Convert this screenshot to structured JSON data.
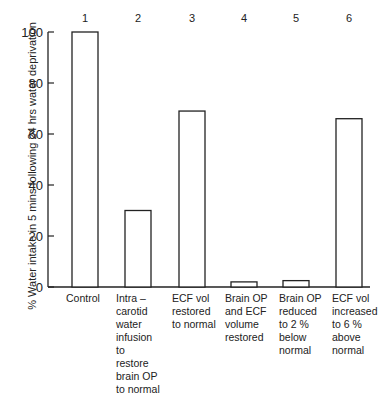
{
  "chart_data": {
    "type": "bar",
    "title": "",
    "xlabel": "",
    "ylabel": "% Water intake in 5 mins following 24 hrs water deprivation",
    "ylim": [
      0,
      100
    ],
    "yticks": [
      0,
      20,
      40,
      60,
      80,
      100
    ],
    "grid": false,
    "bar_numbers": [
      "1",
      "2",
      "3",
      "4",
      "5",
      "6"
    ],
    "categories": [
      "Control",
      "Intra –\ncarotid\nwater\ninfusion\nto\nrestore\nbrain OP\nto normal",
      "ECF vol\nrestored\nto normal",
      "Brain OP\nand ECF\nvolume\nrestored",
      "Brain OP\nreduced\nto 2 %\nbelow\nnormal",
      "ECF vol\nincreased\nto 6 %\nabove\nnormal"
    ],
    "values": [
      100,
      30,
      69,
      2,
      2.5,
      66
    ]
  }
}
